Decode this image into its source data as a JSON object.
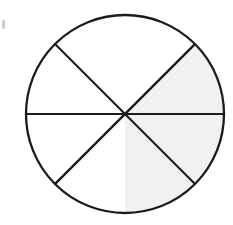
{
  "figure": {
    "name": "fraction-circle",
    "background_color": "#ffffff"
  },
  "chart_data": {
    "type": "pie",
    "title": "",
    "subtitle": "",
    "xlabel": "",
    "ylabel": "",
    "grid": false,
    "legend": "none",
    "total_sectors": 8,
    "shaded_sectors": 3,
    "unshaded_sectors": 5,
    "fraction_shaded": "3/8",
    "sector_angle_degrees": 45,
    "categories": [
      "sector-1",
      "sector-2",
      "sector-3",
      "sector-4",
      "sector-5",
      "sector-6",
      "sector-7",
      "sector-8"
    ],
    "values": [
      45,
      45,
      45,
      45,
      45,
      45,
      45,
      45
    ],
    "series": [
      {
        "name": "sectors",
        "values": [
          45,
          45,
          45,
          45,
          45,
          45,
          45,
          45
        ]
      }
    ],
    "sectors": [
      {
        "id": "sector-1",
        "start_deg": 0,
        "end_deg": 45,
        "clock_position": "12-to-1:30",
        "shaded": false,
        "fill": "#ffffff"
      },
      {
        "id": "sector-2",
        "start_deg": 45,
        "end_deg": 90,
        "clock_position": "1:30-to-3",
        "shaded": true,
        "fill": "#f1f1ef"
      },
      {
        "id": "sector-3",
        "start_deg": 90,
        "end_deg": 135,
        "clock_position": "3-to-4:30",
        "shaded": true,
        "fill": "#f1f1ef"
      },
      {
        "id": "sector-4",
        "start_deg": 135,
        "end_deg": 180,
        "clock_position": "4:30-to-6",
        "shaded": true,
        "fill": "#f1f1ef"
      },
      {
        "id": "sector-5",
        "start_deg": 180,
        "end_deg": 225,
        "clock_position": "6-to-7:30",
        "shaded": false,
        "fill": "#ffffff"
      },
      {
        "id": "sector-6",
        "start_deg": 225,
        "end_deg": 270,
        "clock_position": "7:30-to-9",
        "shaded": false,
        "fill": "#ffffff"
      },
      {
        "id": "sector-7",
        "start_deg": 270,
        "end_deg": 315,
        "clock_position": "9-to-10:30",
        "shaded": false,
        "fill": "#ffffff"
      },
      {
        "id": "sector-8",
        "start_deg": 315,
        "end_deg": 360,
        "clock_position": "10:30-to-12",
        "shaded": false,
        "fill": "#ffffff"
      }
    ],
    "geometry": {
      "center_x": 125,
      "center_y": 114,
      "radius": 99,
      "stroke_color": "#1b1b1b",
      "stroke_width": 2.1,
      "divider_count": 4
    },
    "colors": {
      "shaded_fill": "#f1f1ef",
      "unshaded_fill": "#ffffff",
      "outline": "#1b1b1b",
      "background": "#ffffff"
    }
  }
}
